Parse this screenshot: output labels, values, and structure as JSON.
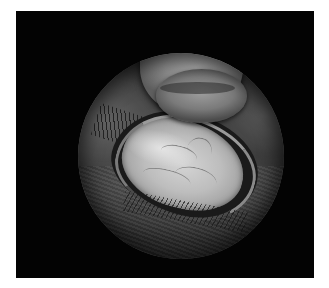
{
  "image": {
    "description": "Clinical photograph of an everted upper eyelid held by a thumb, viewed through a circular (ophthalmoscope-style) vignette on a black background",
    "palette": {
      "background": "#ffffff",
      "panel": "#030303",
      "conjunctiva": "#c8c8c8",
      "skin": "#5a5a5a",
      "thumb": "#9a9a9a"
    },
    "regions": {
      "panel": {
        "x": 16,
        "y": 11,
        "w": 298,
        "h": 267
      },
      "circle": {
        "cx": 165,
        "cy": 145,
        "r": 103
      }
    }
  }
}
